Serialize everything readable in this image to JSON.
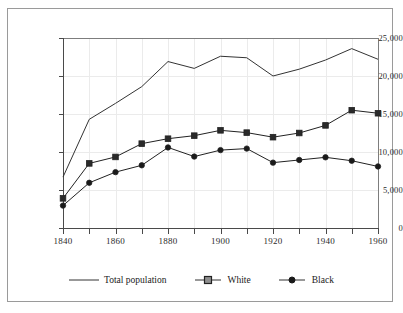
{
  "chart_data": {
    "type": "line",
    "title": "",
    "xlabel": "",
    "ylabel": "",
    "xlim": [
      1840,
      1960
    ],
    "ylim": [
      0,
      25000
    ],
    "grid": true,
    "legend_position": "bottom",
    "x": [
      1840,
      1850,
      1860,
      1870,
      1880,
      1890,
      1900,
      1910,
      1920,
      1930,
      1940,
      1950,
      1960
    ],
    "xtick_labels": [
      "1840",
      "1860",
      "1880",
      "1900",
      "1920",
      "1940",
      "1960"
    ],
    "xtick_values": [
      1840,
      1860,
      1880,
      1900,
      1920,
      1940,
      1960
    ],
    "ytick_labels": [
      "0",
      "5,000",
      "10,000",
      "15,000",
      "20,000",
      "25,000"
    ],
    "ytick_values": [
      0,
      5000,
      10000,
      15000,
      20000,
      25000
    ],
    "series": [
      {
        "name": "Total population",
        "marker": "none",
        "color": "#333333",
        "values": [
          6700,
          14300,
          16400,
          18600,
          21900,
          21000,
          22600,
          22400,
          20000,
          20900,
          22100,
          23600,
          22200
        ]
      },
      {
        "name": "White",
        "marker": "square",
        "color": "#222222",
        "marker_fill": "#2a2a2a",
        "values": [
          3900,
          8500,
          9350,
          11100,
          11750,
          12150,
          12850,
          12550,
          11950,
          12500,
          13500,
          15500,
          15100
        ]
      },
      {
        "name": "Black",
        "marker": "circle",
        "color": "#222222",
        "marker_fill": "#1a1a1a",
        "values": [
          2950,
          5950,
          7350,
          8250,
          10600,
          9400,
          10250,
          10450,
          8600,
          8950,
          9300,
          8850,
          8100
        ]
      }
    ]
  },
  "legend": {
    "items": [
      {
        "label": "Total population",
        "marker": "line"
      },
      {
        "label": "White",
        "marker": "square"
      },
      {
        "label": "Black",
        "marker": "circle"
      }
    ]
  }
}
